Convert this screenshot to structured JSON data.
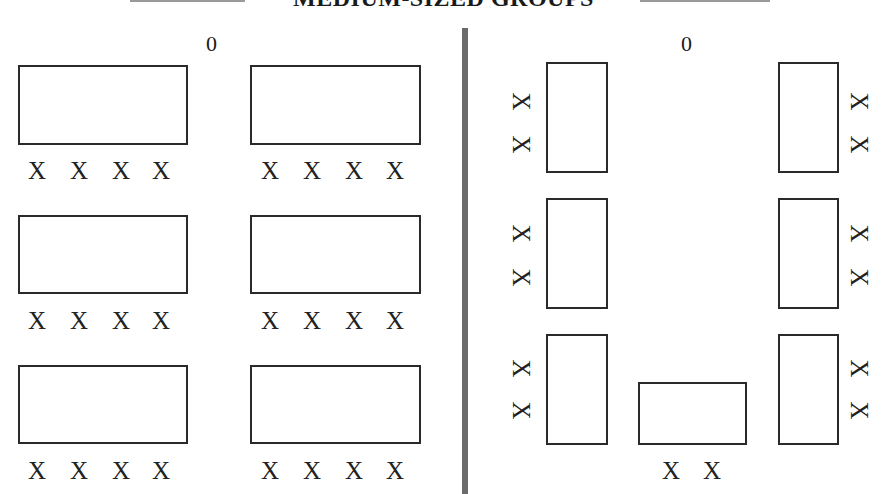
{
  "title": "MEDIUM-SIZED GROUPS",
  "colors": {
    "divider": "#6b6b6b",
    "outline": "#2a2a2a",
    "title_rule": "#9a9a9a"
  },
  "left_panel": {
    "label": "0",
    "seat_symbol": "X",
    "tables": [
      {
        "row": 1,
        "col": 1,
        "seats": [
          "X",
          "X",
          "X",
          "X"
        ]
      },
      {
        "row": 1,
        "col": 2,
        "seats": [
          "X",
          "X",
          "X",
          "X"
        ]
      },
      {
        "row": 2,
        "col": 1,
        "seats": [
          "X",
          "X",
          "X",
          "X"
        ]
      },
      {
        "row": 2,
        "col": 2,
        "seats": [
          "X",
          "X",
          "X",
          "X"
        ]
      },
      {
        "row": 3,
        "col": 1,
        "seats": [
          "X",
          "X",
          "X",
          "X"
        ]
      },
      {
        "row": 3,
        "col": 2,
        "seats": [
          "X",
          "X",
          "X",
          "X"
        ]
      }
    ]
  },
  "right_panel": {
    "label": "0",
    "seat_symbol": "X",
    "tables": [
      {
        "position": "left-top",
        "seats": [
          "X",
          "X"
        ]
      },
      {
        "position": "left-middle",
        "seats": [
          "X",
          "X"
        ]
      },
      {
        "position": "left-bottom",
        "seats": [
          "X",
          "X"
        ]
      },
      {
        "position": "right-top",
        "seats": [
          "X",
          "X"
        ]
      },
      {
        "position": "right-middle",
        "seats": [
          "X",
          "X"
        ]
      },
      {
        "position": "right-bottom",
        "seats": [
          "X",
          "X"
        ]
      },
      {
        "position": "center-bottom",
        "seats": [
          "X",
          "X"
        ]
      }
    ]
  }
}
